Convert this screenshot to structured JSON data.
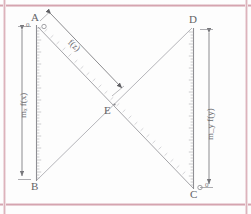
{
  "figure": {
    "type": "geometry-diagram",
    "caption_present": false,
    "points": [
      {
        "id": "A",
        "label": "A",
        "position": "top-left",
        "x": 36,
        "y": 24,
        "marker": "small-circle"
      },
      {
        "id": "B",
        "label": "B",
        "position": "bottom-left",
        "x": 36,
        "y": 180,
        "marker": "none"
      },
      {
        "id": "C",
        "label": "C",
        "position": "bottom-right",
        "x": 194,
        "y": 190,
        "marker": "small-circle"
      },
      {
        "id": "D",
        "label": "D",
        "position": "top-right",
        "x": 194,
        "y": 26,
        "marker": "none"
      },
      {
        "id": "E",
        "label": "E",
        "position": "center",
        "x": 114,
        "y": 104,
        "marker": "intersection"
      }
    ],
    "segments": [
      {
        "id": "AB",
        "from": "A",
        "to": "B",
        "style": "ruler-scale"
      },
      {
        "id": "DC",
        "from": "D",
        "to": "C",
        "style": "ruler-scale"
      },
      {
        "id": "AC",
        "from": "A",
        "to": "C",
        "style": "ruler-scale-diagonal"
      },
      {
        "id": "BD",
        "from": "B",
        "to": "D",
        "style": "thin-line"
      }
    ],
    "dimensions": [
      {
        "id": "left-dim",
        "label": "mₓ f(x)",
        "label_plain": "m_x f(x)",
        "orientation": "vertical",
        "side": "left",
        "arrows": "both"
      },
      {
        "id": "right-dim",
        "label": "m_y f(y)",
        "label_plain": "m_y f(y)",
        "orientation": "vertical",
        "side": "right",
        "arrows": "both"
      },
      {
        "id": "diagonal-dim",
        "label": "f(z)",
        "label_plain": "f(z)",
        "orientation": "diagonal",
        "side": "upper",
        "arrows": "both"
      }
    ],
    "scale_origins": [
      {
        "id": "origin-A",
        "label": "0",
        "at": "A"
      },
      {
        "id": "origin-C",
        "label": "0",
        "at": "C"
      }
    ],
    "colors": {
      "ink": "#6d6d70",
      "line": "#9a9a9e",
      "page": "#fdfdfd",
      "rule": "#d8a9b4"
    }
  }
}
